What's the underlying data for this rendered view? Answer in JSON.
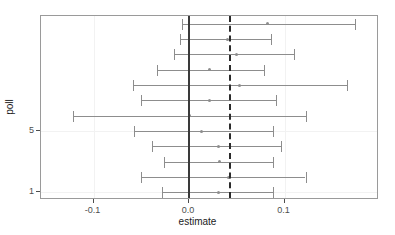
{
  "chart_data": {
    "type": "scatter",
    "subtype": "forest-plot",
    "title": "",
    "xlabel": "estimate",
    "ylabel": "poll",
    "xlim": [
      -0.155,
      0.199
    ],
    "ylim": [
      0.5,
      12.5
    ],
    "xticks": [
      -0.1,
      0.0,
      0.1
    ],
    "xticklabels": [
      "-0.1",
      "0.0",
      "0.1"
    ],
    "yticks": [
      1,
      5
    ],
    "yticklabels": [
      "1",
      "5"
    ],
    "grid": true,
    "legend": null,
    "reference_lines": [
      {
        "name": "zero-line",
        "x": 0.0,
        "style": "solid",
        "color": "#3a3a3a"
      },
      {
        "name": "pooled-estimate-line",
        "x": 0.043,
        "style": "dashed",
        "color": "#2b2b2b"
      }
    ],
    "point_color": "#8d8d8d",
    "errorbar_color": "#8d8d8d",
    "series": [
      {
        "name": "estimate",
        "points": [
          {
            "poll": 12,
            "estimate": 0.082,
            "low": -0.007,
            "high": 0.174
          },
          {
            "poll": 11,
            "estimate": 0.04,
            "low": -0.009,
            "high": 0.086
          },
          {
            "poll": 10,
            "estimate": 0.05,
            "low": -0.016,
            "high": 0.11
          },
          {
            "poll": 9,
            "estimate": 0.021,
            "low": -0.034,
            "high": 0.079
          },
          {
            "poll": 8,
            "estimate": 0.053,
            "low": -0.059,
            "high": 0.165
          },
          {
            "poll": 7,
            "estimate": 0.021,
            "low": -0.05,
            "high": 0.091
          },
          {
            "poll": 6,
            "estimate": 0.0,
            "low": -0.122,
            "high": 0.122
          },
          {
            "poll": 5,
            "estimate": 0.013,
            "low": -0.058,
            "high": 0.088
          },
          {
            "poll": 4,
            "estimate": 0.031,
            "low": -0.039,
            "high": 0.096
          },
          {
            "poll": 3,
            "estimate": 0.032,
            "low": -0.026,
            "high": 0.088
          },
          {
            "poll": 2,
            "estimate": 0.041,
            "low": -0.05,
            "high": 0.122
          },
          {
            "poll": 1,
            "estimate": 0.031,
            "low": -0.028,
            "high": 0.088
          }
        ]
      }
    ]
  }
}
